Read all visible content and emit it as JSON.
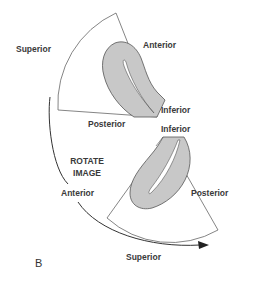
{
  "figure": {
    "panel_label": "B",
    "colors": {
      "outline": "#555555",
      "tissue_fill": "#c8c8c8",
      "background": "#ffffff",
      "text": "#3a3a3a"
    },
    "top_sector": {
      "labels": {
        "left": "Superior",
        "top_right": "Anterior",
        "apex": "Inferior",
        "bottom": "Posterior"
      }
    },
    "bottom_sector": {
      "labels": {
        "apex": "Inferior",
        "right": "Posterior",
        "left": "Anterior",
        "bottom": "Superior"
      }
    },
    "rotation": {
      "line1": "ROTATE",
      "line2": "IMAGE"
    }
  }
}
